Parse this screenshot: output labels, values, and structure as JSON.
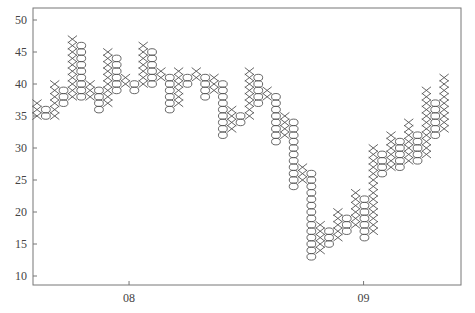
{
  "chart_data": {
    "type": "point-and-figure",
    "title": "",
    "xlabel": "",
    "ylabel": "",
    "ylim": [
      8,
      52
    ],
    "box_size": 1,
    "y_ticks": [
      10,
      15,
      20,
      25,
      30,
      35,
      40,
      45,
      50
    ],
    "x_ticks": [
      {
        "label": "08",
        "column_position": 10.4
      },
      {
        "label": "09",
        "column_position": 36.9
      }
    ],
    "grid": false,
    "legend": null,
    "colors": {
      "marks": "#555555",
      "axis": "#777777",
      "text": "#444444"
    },
    "columns": [
      {
        "type": "X",
        "low": 35,
        "high": 37
      },
      {
        "type": "O",
        "low": 35,
        "high": 36
      },
      {
        "type": "X",
        "low": 35,
        "high": 40
      },
      {
        "type": "O",
        "low": 37,
        "high": 39
      },
      {
        "type": "X",
        "low": 38,
        "high": 47
      },
      {
        "type": "O",
        "low": 38,
        "high": 46
      },
      {
        "type": "X",
        "low": 38,
        "high": 40
      },
      {
        "type": "O",
        "low": 36,
        "high": 39
      },
      {
        "type": "X",
        "low": 37,
        "high": 45
      },
      {
        "type": "O",
        "low": 39,
        "high": 44
      },
      {
        "type": "X",
        "low": 40,
        "high": 41
      },
      {
        "type": "O",
        "low": 39,
        "high": 40
      },
      {
        "type": "X",
        "low": 40,
        "high": 46
      },
      {
        "type": "O",
        "low": 40,
        "high": 45
      },
      {
        "type": "X",
        "low": 41,
        "high": 42
      },
      {
        "type": "O",
        "low": 36,
        "high": 41
      },
      {
        "type": "X",
        "low": 37,
        "high": 42
      },
      {
        "type": "O",
        "low": 40,
        "high": 41
      },
      {
        "type": "X",
        "low": 41,
        "high": 42
      },
      {
        "type": "O",
        "low": 38,
        "high": 41
      },
      {
        "type": "X",
        "low": 39,
        "high": 41
      },
      {
        "type": "O",
        "low": 32,
        "high": 40
      },
      {
        "type": "X",
        "low": 33,
        "high": 36
      },
      {
        "type": "O",
        "low": 34,
        "high": 35
      },
      {
        "type": "X",
        "low": 35,
        "high": 42
      },
      {
        "type": "O",
        "low": 37,
        "high": 41
      },
      {
        "type": "X",
        "low": 38,
        "high": 39
      },
      {
        "type": "O",
        "low": 31,
        "high": 38
      },
      {
        "type": "X",
        "low": 32,
        "high": 35
      },
      {
        "type": "O",
        "low": 24,
        "high": 34
      },
      {
        "type": "X",
        "low": 25,
        "high": 27
      },
      {
        "type": "O",
        "low": 13,
        "high": 26
      },
      {
        "type": "X",
        "low": 14,
        "high": 18
      },
      {
        "type": "O",
        "low": 15,
        "high": 17
      },
      {
        "type": "X",
        "low": 16,
        "high": 20
      },
      {
        "type": "O",
        "low": 17,
        "high": 19
      },
      {
        "type": "X",
        "low": 18,
        "high": 23
      },
      {
        "type": "O",
        "low": 16,
        "high": 22
      },
      {
        "type": "X",
        "low": 17,
        "high": 30
      },
      {
        "type": "O",
        "low": 26,
        "high": 29
      },
      {
        "type": "X",
        "low": 27,
        "high": 32
      },
      {
        "type": "O",
        "low": 27,
        "high": 31
      },
      {
        "type": "X",
        "low": 28,
        "high": 34
      },
      {
        "type": "O",
        "low": 28,
        "high": 32
      },
      {
        "type": "X",
        "low": 29,
        "high": 39
      },
      {
        "type": "O",
        "low": 32,
        "high": 37
      },
      {
        "type": "X",
        "low": 33,
        "high": 41
      }
    ]
  }
}
